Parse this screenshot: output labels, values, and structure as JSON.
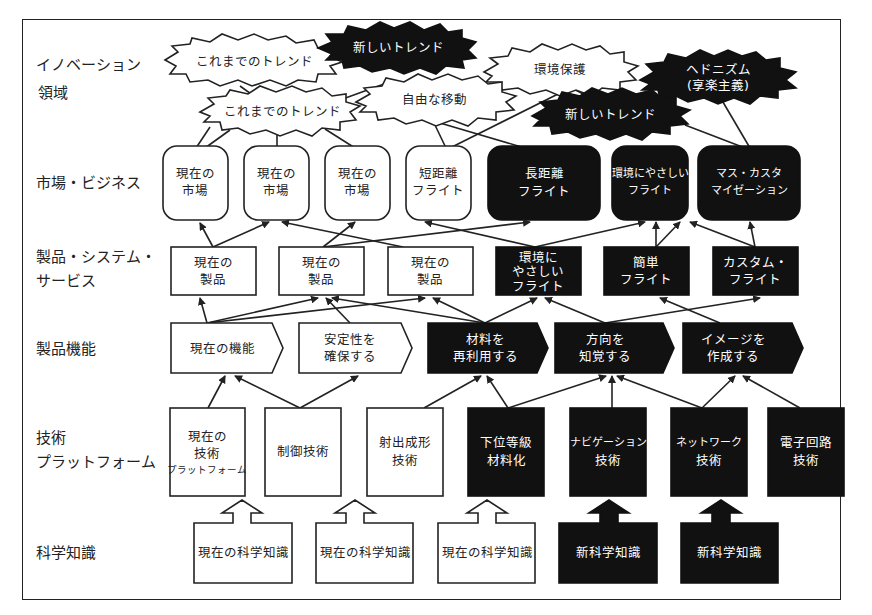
{
  "row_labels": {
    "innovation": [
      "イノベーション",
      "領域"
    ],
    "market": "市場・ビジネス",
    "product": [
      "製品・システム・",
      "サービス"
    ],
    "function": "製品機能",
    "technology": [
      "技術",
      "プラットフォーム"
    ],
    "science": "科学知識"
  },
  "innovation": [
    {
      "id": "trend_old_1",
      "label": "これまでのトレンド",
      "style": "white"
    },
    {
      "id": "trend_new_1",
      "label": "新しいトレンド",
      "style": "black"
    },
    {
      "id": "env",
      "label": "環境保護",
      "style": "white"
    },
    {
      "id": "hedonism",
      "label": [
        "ヘドニズム",
        "(享楽主義)"
      ],
      "style": "black"
    },
    {
      "id": "trend_old_2",
      "label": "これまでのトレンド",
      "style": "white"
    },
    {
      "id": "free_move",
      "label": "自由な移動",
      "style": "white"
    },
    {
      "id": "trend_new_2",
      "label": "新しいトレンド",
      "style": "black"
    }
  ],
  "market": [
    {
      "label": [
        "現在の",
        "市場"
      ],
      "style": "white"
    },
    {
      "label": [
        "現在の",
        "市場"
      ],
      "style": "white"
    },
    {
      "label": [
        "現在の",
        "市場"
      ],
      "style": "white"
    },
    {
      "label": [
        "短距離",
        "フライト"
      ],
      "style": "white"
    },
    {
      "label": [
        "長距離",
        "フライト"
      ],
      "style": "black"
    },
    {
      "label": [
        "環境にやさしい",
        "フライト"
      ],
      "style": "black"
    },
    {
      "label": [
        "マス・カスタ",
        "マイゼーション"
      ],
      "style": "black"
    }
  ],
  "product": [
    {
      "label": [
        "現在の",
        "製品"
      ],
      "style": "white"
    },
    {
      "label": [
        "現在の",
        "製品"
      ],
      "style": "white"
    },
    {
      "label": [
        "現在の",
        "製品"
      ],
      "style": "white"
    },
    {
      "label": [
        "環境に",
        "やさしい",
        "フライト"
      ],
      "style": "black"
    },
    {
      "label": [
        "簡単",
        "フライト"
      ],
      "style": "black"
    },
    {
      "label": [
        "カスタム・",
        "フライト"
      ],
      "style": "black"
    }
  ],
  "function": [
    {
      "label": [
        "現在の機能"
      ],
      "style": "white"
    },
    {
      "label": [
        "安定性を",
        "確保する"
      ],
      "style": "white"
    },
    {
      "label": [
        "材料を",
        "再利用する"
      ],
      "style": "black"
    },
    {
      "label": [
        "方向を",
        "知覚する"
      ],
      "style": "black"
    },
    {
      "label": [
        "イメージを",
        "作成する"
      ],
      "style": "black"
    }
  ],
  "technology": [
    {
      "label": [
        "現在の",
        "技術",
        "プラットフォーム"
      ],
      "style": "white"
    },
    {
      "label": [
        "制御技術"
      ],
      "style": "white"
    },
    {
      "label": [
        "射出成形",
        "技術"
      ],
      "style": "white"
    },
    {
      "label": [
        "下位等級",
        "材料化"
      ],
      "style": "black"
    },
    {
      "label": [
        "ナビゲーション",
        "技術"
      ],
      "style": "black"
    },
    {
      "label": [
        "ネットワーク",
        "技術"
      ],
      "style": "black"
    },
    {
      "label": [
        "電子回路",
        "技術"
      ],
      "style": "black"
    }
  ],
  "science": [
    {
      "label": "現在の科学知識",
      "style": "white"
    },
    {
      "label": "現在の科学知識",
      "style": "white"
    },
    {
      "label": "現在の科学知識",
      "style": "white"
    },
    {
      "label": "新科学知識",
      "style": "black"
    },
    {
      "label": "新科学知識",
      "style": "black"
    }
  ]
}
